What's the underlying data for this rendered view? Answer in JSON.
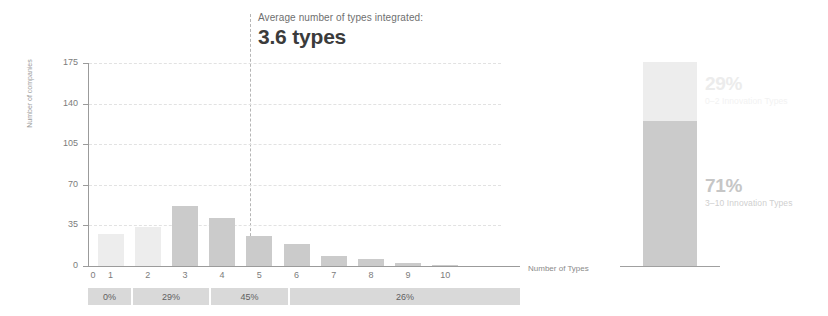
{
  "annotation": {
    "caption": "Average number of types integrated:",
    "value": "3.6 types"
  },
  "chart_data": {
    "type": "bar",
    "title": "",
    "xlabel": "Number of Types",
    "ylabel": "Number of companies",
    "categories": [
      "0",
      "1",
      "2",
      "3",
      "4",
      "5",
      "6",
      "7",
      "8",
      "9",
      "10"
    ],
    "values": [
      0,
      28,
      34,
      52,
      41,
      26,
      19,
      9,
      6,
      3,
      1
    ],
    "ylim": [
      0,
      175
    ],
    "yticks": [
      "0",
      "35",
      "70",
      "105",
      "140",
      "175"
    ],
    "grid": true,
    "legend": "none",
    "annotations": [
      {
        "label": "Average number of types integrated:",
        "value": "3.6 types",
        "x": 3.6
      }
    ],
    "bar_colors": [
      "#ededed",
      "#ededed",
      "#ededed",
      "#cbcbcb",
      "#cbcbcb",
      "#cbcbcb",
      "#cbcbcb",
      "#cbcbcb",
      "#cbcbcb",
      "#cbcbcb",
      "#cbcbcb"
    ]
  },
  "percent_strip": {
    "segments": [
      {
        "label": "0%",
        "left": 0,
        "width": 43
      },
      {
        "label": "29%",
        "width": 76,
        "left": 45
      },
      {
        "label": "45%",
        "width": 77,
        "left": 123
      },
      {
        "label": "26%",
        "width": 230,
        "left": 202
      }
    ]
  },
  "stacked_chart": {
    "type": "bar",
    "segments": [
      {
        "pct": "29%",
        "label": "0–2 Innovation Types",
        "value": 29,
        "color": "#ededed"
      },
      {
        "pct": "71%",
        "label": "3–10 Innovation Types",
        "value": 71,
        "color": "#cbcbcb"
      }
    ]
  },
  "colors": {
    "bar_light": "#ededed",
    "bar_dark": "#cbcbcb",
    "strip": "#d9d9d9",
    "axis": "#9b9b9b",
    "grid": "#e2e2e2",
    "text": "#7c7c7c",
    "value_text": "#3b3b3b"
  }
}
